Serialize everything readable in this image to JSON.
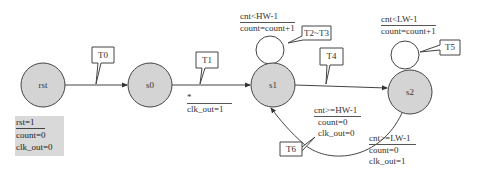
{
  "diagram": {
    "type": "state-machine",
    "states": [
      {
        "id": "rst",
        "label": "rst"
      },
      {
        "id": "s0",
        "label": "s0"
      },
      {
        "id": "s1",
        "label": "s1"
      },
      {
        "id": "s2",
        "label": "s2"
      }
    ],
    "transitions": [
      {
        "id": "T0",
        "label": "T0",
        "from": "rst",
        "to": "s0"
      },
      {
        "id": "T1",
        "label": "T1",
        "from": "s0",
        "to": "s1",
        "condition": "*",
        "action": "clk_out=1"
      },
      {
        "id": "T2~T3",
        "label": "T2~T3",
        "from": "s1",
        "to": "s1",
        "condition": "cnt<HW-1",
        "action": "count=count+1"
      },
      {
        "id": "T4",
        "label": "T4",
        "from": "s1",
        "to": "s2",
        "condition": "cnt>=HW-1",
        "action1": "count=0",
        "action2": "clk_out=0"
      },
      {
        "id": "T5",
        "label": "T5",
        "from": "s2",
        "to": "s2",
        "condition": "cnt<LW-1",
        "action": "count=count+1"
      },
      {
        "id": "T6",
        "label": "T6",
        "from": "s2",
        "to": "s1",
        "condition": "cnt>=LW-1",
        "action1": "count=0",
        "action2": "clk_out=1"
      }
    ],
    "reset": {
      "condition": "rst=1",
      "action1": "count=0",
      "action2": "clk_out=0"
    },
    "colors": {
      "state_fill": "#d4d4d4",
      "stroke": "#444444",
      "reset_box": "#d9d9d9"
    }
  }
}
